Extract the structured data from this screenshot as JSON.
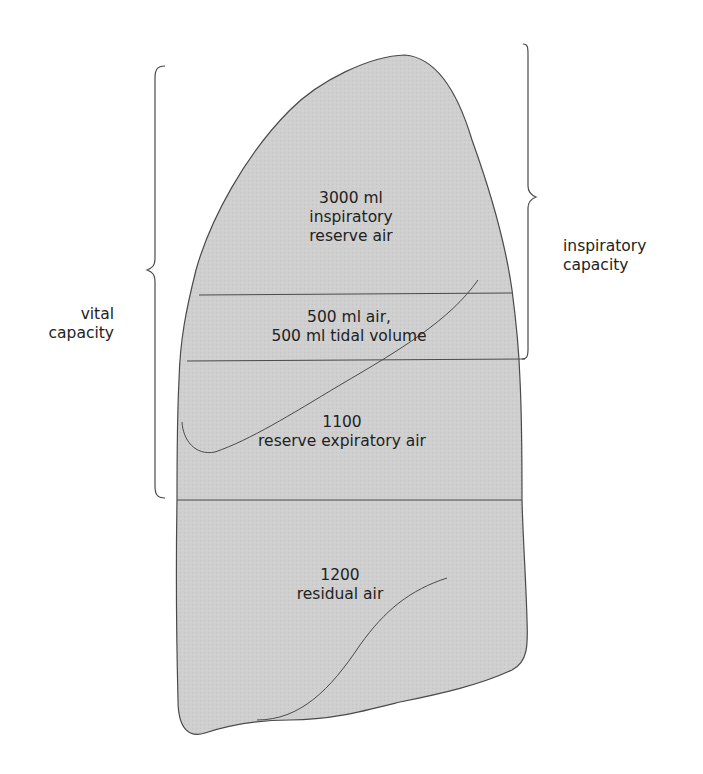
{
  "figure": {
    "colors": {
      "fill": "#cfcfcf",
      "stroke": "#4a4a4a",
      "text": "#222222",
      "background": "#ffffff"
    }
  },
  "compartments": [
    {
      "id": "inspiratory-reserve",
      "line1": "3000 ml",
      "line2": "inspiratory",
      "line3": "reserve air",
      "volume_ml": 3000
    },
    {
      "id": "tidal",
      "line1": "500 ml air,",
      "line2": "500 ml tidal volume",
      "volume_ml": 500
    },
    {
      "id": "expiratory-reserve",
      "line1": "1100",
      "line2": "reserve expiratory air",
      "volume_ml": 1100
    },
    {
      "id": "residual",
      "line1": "1200",
      "line2": "residual air",
      "volume_ml": 1200
    }
  ],
  "braces": {
    "left": {
      "line1": "vital",
      "line2": "capacity"
    },
    "right": {
      "line1": "inspiratory",
      "line2": "capacity"
    }
  }
}
